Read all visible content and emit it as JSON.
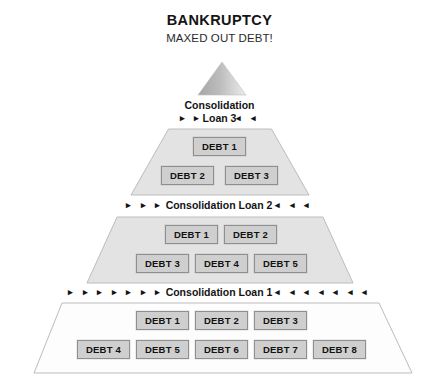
{
  "title": {
    "main": "BANKRUPTCY",
    "sub": "MAXED OUT DEBT!"
  },
  "colors": {
    "tier_fill_gray": "#e3e3e3",
    "tier_fill_white": "#fdfdfd",
    "tier_border": "#b4b4b4",
    "debt_box_fill": "#cfcfcf",
    "debt_box_border": "#8f8f8f",
    "text": "#141414",
    "apex_gradient_start": "#9f9f9f",
    "apex_gradient_end": "#e8e8e8"
  },
  "apex": {
    "name": "bankruptcy-apex",
    "label_line1": "Consolidation",
    "label_line2_text": "Loan 3",
    "arrows_left": "▸ ▸",
    "arrows_right": "◂ ◂"
  },
  "loan_bands": [
    {
      "id": "loan-3",
      "label": "Loan 3",
      "full_label": "Consolidation Loan 3",
      "arrow_count": 2,
      "arrows_left": "▸ ▸",
      "arrows_right": "◂ ◂"
    },
    {
      "id": "loan-2",
      "label": "Consolidation Loan 2",
      "arrow_count": 3,
      "arrows_left": "▸ ▸ ▸",
      "arrows_right": "◂ ◂ ◂"
    },
    {
      "id": "loan-1",
      "label": "Consolidation Loan 1",
      "arrow_count": 7,
      "arrows_left": "▸ ▸ ▸ ▸ ▸ ▸ ▸",
      "arrows_right": "◂ ◂ ◂ ◂ ◂ ◂ ◂"
    }
  ],
  "tiers": [
    {
      "id": "tier-2",
      "fill": "gray",
      "rows": [
        [
          "DEBT 1"
        ],
        [
          "DEBT 2",
          "DEBT 3"
        ]
      ]
    },
    {
      "id": "tier-3",
      "fill": "gray",
      "rows": [
        [
          "DEBT 1",
          "DEBT 2"
        ],
        [
          "DEBT 3",
          "DEBT 4",
          "DEBT 5"
        ]
      ]
    },
    {
      "id": "tier-4",
      "fill": "white",
      "rows": [
        [
          "DEBT 1",
          "DEBT 2",
          "DEBT 3"
        ],
        [
          "DEBT 4",
          "DEBT 5",
          "DEBT 6",
          "DEBT 7",
          "DEBT 8"
        ]
      ]
    }
  ],
  "debt_labels": {
    "t2r1c1": "DEBT 1",
    "t2r2c1": "DEBT 2",
    "t2r2c2": "DEBT 3",
    "t3r1c1": "DEBT 1",
    "t3r1c2": "DEBT 2",
    "t3r2c1": "DEBT 3",
    "t3r2c2": "DEBT 4",
    "t3r2c3": "DEBT 5",
    "t4r1c1": "DEBT 1",
    "t4r1c2": "DEBT 2",
    "t4r1c3": "DEBT 3",
    "t4r2c1": "DEBT 4",
    "t4r2c2": "DEBT 5",
    "t4r2c3": "DEBT 6",
    "t4r2c4": "DEBT 7",
    "t4r2c5": "DEBT 8"
  }
}
